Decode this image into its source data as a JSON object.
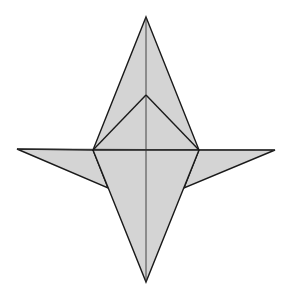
{
  "diagram": {
    "type": "origami-fold-diagram",
    "width": 293,
    "height": 290,
    "colors": {
      "background": "#ffffff",
      "paper_fill": "#d4d4d4",
      "edge": "#1a1a1a",
      "crease": "#333333"
    },
    "vertices": {
      "top_apex": [
        146,
        17
      ],
      "inner_apex": [
        146,
        95
      ],
      "left_junction": [
        93,
        150
      ],
      "right_junction": [
        199,
        150
      ],
      "left_tip": [
        17,
        149
      ],
      "right_tip": [
        275,
        150
      ],
      "left_wing_corner": [
        108,
        188
      ],
      "right_wing_corner": [
        184,
        188
      ],
      "bottom_apex": [
        146,
        282
      ],
      "center": [
        146,
        150
      ]
    },
    "polygons": [
      {
        "name": "left-wing",
        "points": "17,149 93,150 108,188"
      },
      {
        "name": "right-wing",
        "points": "275,150 199,150 184,188"
      },
      {
        "name": "upper-kite",
        "points": "146,17 199,150 93,150"
      },
      {
        "name": "lower-kite",
        "points": "93,150 199,150 146,282"
      }
    ],
    "lines": [
      {
        "name": "center-vertical-crease",
        "x1": 146,
        "y1": 17,
        "x2": 146,
        "y2": 282
      },
      {
        "name": "horizontal-crease",
        "x1": 17,
        "y1": 149,
        "x2": 275,
        "y2": 150
      },
      {
        "name": "inner-left-fold",
        "x1": 146,
        "y1": 95,
        "x2": 93,
        "y2": 150
      },
      {
        "name": "inner-right-fold",
        "x1": 146,
        "y1": 95,
        "x2": 199,
        "y2": 150
      }
    ]
  }
}
